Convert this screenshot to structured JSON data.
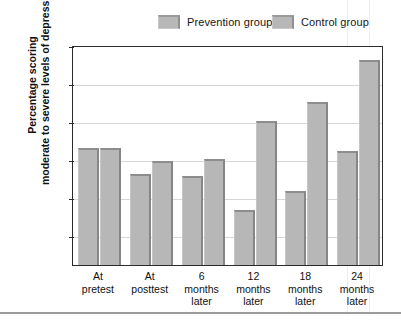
{
  "chart_data": {
    "type": "bar",
    "title": "",
    "xlabel": "",
    "ylabel": "Percentage scoring moderate to severe levels of depression",
    "ylabel_lines": [
      "Percentage scoring",
      "moderate to severe levels of depression"
    ],
    "ylim": [
      0,
      50
    ],
    "yticks": [
      0,
      10,
      20,
      30,
      40,
      50
    ],
    "ytick_labels": [
      "0",
      "10",
      "20",
      "30",
      "40",
      "50"
    ],
    "grid": true,
    "legend_position": "top",
    "categories": [
      "At pretest",
      "At posttest",
      "6 months later",
      "12 months later",
      "18 months later",
      "24 months later"
    ],
    "category_lines": [
      [
        "At",
        "pretest"
      ],
      [
        "At",
        "posttest"
      ],
      [
        "6",
        "months",
        "later"
      ],
      [
        "12",
        "months",
        "later"
      ],
      [
        "18",
        "months",
        "later"
      ],
      [
        "24",
        "months",
        "later"
      ]
    ],
    "series": [
      {
        "name": "Prevention group",
        "values": [
          23,
          16,
          15.5,
          6.5,
          11.5,
          22
        ]
      },
      {
        "name": "Control group",
        "values": [
          23,
          19.5,
          20,
          30,
          35,
          46
        ]
      }
    ]
  },
  "legend": {
    "items": [
      {
        "label": "Prevention group"
      },
      {
        "label": "Control group"
      }
    ]
  },
  "colors": {
    "bar_fill": "#b7b7b7",
    "bar_edge": "#8d8d8d",
    "frame": "#2b2b2b",
    "gridline": "#d7d7d7",
    "text": "#121212",
    "background": "#ffffff"
  }
}
